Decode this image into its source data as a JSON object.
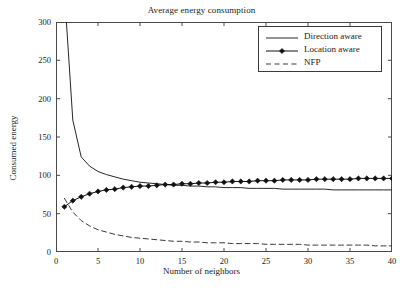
{
  "chart_data": {
    "type": "line",
    "title": "Average energy consumption",
    "xlabel": "Number of neighbors",
    "ylabel": "Consumed energy",
    "xlim": [
      0,
      40
    ],
    "ylim": [
      0,
      300
    ],
    "xticks": [
      0,
      5,
      10,
      15,
      20,
      25,
      30,
      35,
      40
    ],
    "yticks": [
      0,
      50,
      100,
      150,
      200,
      250,
      300
    ],
    "grid": false,
    "legend_position": "top-right",
    "x": [
      1,
      2,
      3,
      4,
      5,
      6,
      7,
      8,
      9,
      10,
      11,
      12,
      13,
      14,
      15,
      16,
      17,
      18,
      19,
      20,
      21,
      22,
      23,
      24,
      25,
      26,
      27,
      28,
      29,
      30,
      31,
      32,
      33,
      34,
      35,
      36,
      37,
      38,
      39,
      40
    ],
    "series": [
      {
        "name": "Direction aware",
        "style": "solid",
        "marker": "none",
        "color": "#262626",
        "values": [
          340,
          172,
          124,
          112,
          105,
          101,
          98,
          95,
          93,
          91,
          90,
          89,
          88,
          87,
          87,
          86,
          86,
          85,
          85,
          84,
          84,
          84,
          83,
          83,
          83,
          83,
          82,
          82,
          82,
          82,
          82,
          82,
          81,
          81,
          81,
          81,
          81,
          81,
          81,
          81
        ]
      },
      {
        "name": "Location aware",
        "style": "solid",
        "marker": "diamond",
        "color": "#111111",
        "values": [
          59,
          67,
          72,
          76,
          79,
          81,
          82,
          84,
          85,
          86,
          86,
          87,
          88,
          88,
          89,
          89,
          90,
          90,
          91,
          91,
          92,
          92,
          92,
          93,
          93,
          93,
          94,
          94,
          94,
          94,
          95,
          95,
          95,
          95,
          95,
          96,
          96,
          96,
          96,
          96
        ]
      },
      {
        "name": "NFP",
        "style": "dashed",
        "marker": "none",
        "color": "#3a3a3a",
        "values": [
          70,
          52,
          41,
          34,
          29,
          26,
          23,
          21,
          19,
          18,
          17,
          16,
          15,
          14,
          14,
          13,
          13,
          12,
          12,
          12,
          11,
          11,
          11,
          11,
          10,
          10,
          10,
          10,
          10,
          9,
          9,
          9,
          9,
          9,
          9,
          9,
          9,
          8,
          8,
          8
        ]
      }
    ]
  }
}
